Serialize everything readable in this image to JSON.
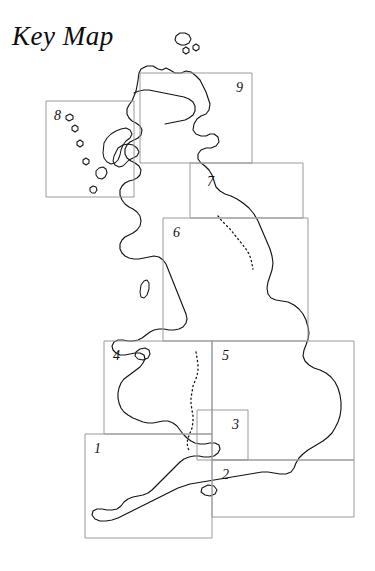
{
  "page": {
    "title": "Key Map",
    "width": 375,
    "height": 571,
    "background_color": "#ffffff"
  },
  "map": {
    "name": "united-kingdom-key-map",
    "coastline_color": "#141414",
    "grid_color": "#9a9a9a",
    "border_style": "dotted",
    "regions_depicted": [
      "Scotland",
      "England",
      "Wales",
      "Outer Hebrides",
      "Isle of Skye",
      "Orkney Islands",
      "Isle of Man",
      "Isle of Wight",
      "Anglesey"
    ]
  },
  "grid_cells": [
    {
      "number": "1",
      "x": 85,
      "y": 434,
      "width": 127,
      "height": 104,
      "label_x": 94,
      "label_y": 442
    },
    {
      "number": "2",
      "x": 212,
      "y": 460,
      "width": 142,
      "height": 57,
      "label_x": 222,
      "label_y": 468
    },
    {
      "number": "3",
      "x": 197,
      "y": 410,
      "width": 51,
      "height": 50,
      "label_x": 232,
      "label_y": 418
    },
    {
      "number": "4",
      "x": 104,
      "y": 341,
      "width": 108,
      "height": 93,
      "label_x": 113,
      "label_y": 349
    },
    {
      "number": "5",
      "x": 212,
      "y": 341,
      "width": 142,
      "height": 119,
      "label_x": 222,
      "label_y": 349
    },
    {
      "number": "6",
      "x": 163,
      "y": 218,
      "width": 145,
      "height": 123,
      "label_x": 173,
      "label_y": 226
    },
    {
      "number": "7",
      "x": 190,
      "y": 163,
      "width": 113,
      "height": 55,
      "label_x": 207,
      "label_y": 175
    },
    {
      "number": "8",
      "x": 46,
      "y": 101,
      "width": 88,
      "height": 96,
      "label_x": 54,
      "label_y": 109
    },
    {
      "number": "9",
      "x": 140,
      "y": 73,
      "width": 112,
      "height": 90,
      "label_x": 236,
      "label_y": 81
    }
  ],
  "cell_numbers": [
    "1",
    "2",
    "3",
    "4",
    "5",
    "6",
    "7",
    "8",
    "9"
  ]
}
